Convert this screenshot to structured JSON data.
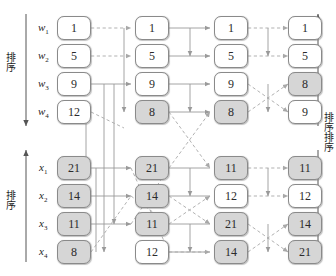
{
  "diagram": {
    "columns": 4,
    "rows_top": 4,
    "rows_bottom": 4,
    "colors": {
      "node_fill_plain": "#ffffff",
      "node_fill_shaded": "#d6d6d6",
      "node_border": "#8a8a8a",
      "arrow_solid": "#9a9a9a",
      "arrow_dashed": "#a8a8a8",
      "text": "#1d1d1d"
    }
  },
  "labels": {
    "top": [
      {
        "name": "w",
        "sub": "1"
      },
      {
        "name": "w",
        "sub": "2"
      },
      {
        "name": "w",
        "sub": "3"
      },
      {
        "name": "w",
        "sub": "4"
      }
    ],
    "bottom": [
      {
        "name": "x",
        "sub": "1"
      },
      {
        "name": "x",
        "sub": "2"
      },
      {
        "name": "x",
        "sub": "3"
      },
      {
        "name": "x",
        "sub": "4"
      }
    ]
  },
  "axes": {
    "left_top": {
      "caption": "排序",
      "direction": "down"
    },
    "left_bottom": {
      "caption": "排序",
      "direction": "up"
    },
    "right_top": {
      "caption": "排序",
      "direction": "up"
    },
    "right_bottom": {
      "caption": "排序",
      "direction": "down"
    }
  },
  "nodes": {
    "top": [
      [
        {
          "value": "1",
          "shaded": false
        },
        {
          "value": "5",
          "shaded": false
        },
        {
          "value": "9",
          "shaded": false
        },
        {
          "value": "12",
          "shaded": false
        }
      ],
      [
        {
          "value": "1",
          "shaded": false
        },
        {
          "value": "5",
          "shaded": false
        },
        {
          "value": "9",
          "shaded": false
        },
        {
          "value": "8",
          "shaded": true
        }
      ],
      [
        {
          "value": "1",
          "shaded": false
        },
        {
          "value": "5",
          "shaded": false
        },
        {
          "value": "9",
          "shaded": false
        },
        {
          "value": "8",
          "shaded": true
        }
      ],
      [
        {
          "value": "1",
          "shaded": false
        },
        {
          "value": "5",
          "shaded": false
        },
        {
          "value": "8",
          "shaded": true
        },
        {
          "value": "9",
          "shaded": false
        }
      ]
    ],
    "bottom": [
      [
        {
          "value": "21",
          "shaded": true
        },
        {
          "value": "14",
          "shaded": true
        },
        {
          "value": "11",
          "shaded": true
        },
        {
          "value": "8",
          "shaded": true
        }
      ],
      [
        {
          "value": "21",
          "shaded": true
        },
        {
          "value": "14",
          "shaded": true
        },
        {
          "value": "11",
          "shaded": true
        },
        {
          "value": "12",
          "shaded": false
        }
      ],
      [
        {
          "value": "11",
          "shaded": true
        },
        {
          "value": "12",
          "shaded": false
        },
        {
          "value": "21",
          "shaded": true
        },
        {
          "value": "14",
          "shaded": true
        }
      ],
      [
        {
          "value": "11",
          "shaded": true
        },
        {
          "value": "12",
          "shaded": false
        },
        {
          "value": "14",
          "shaded": true
        },
        {
          "value": "21",
          "shaded": true
        }
      ]
    ]
  }
}
